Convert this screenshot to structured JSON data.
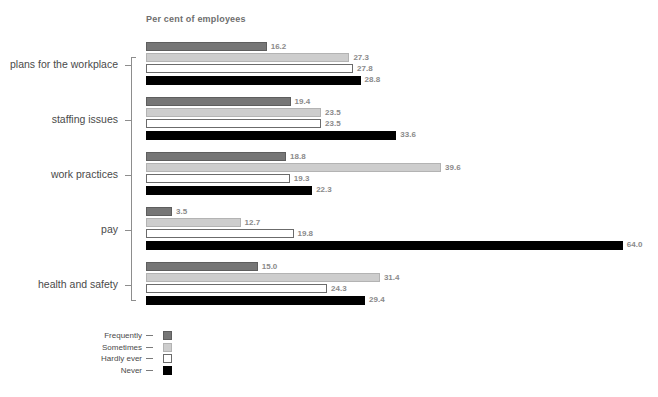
{
  "chart_data": {
    "type": "bar",
    "title": "",
    "xlabel": "Per cent of employees",
    "ylabel": "",
    "orientation": "horizontal",
    "grid": false,
    "legend_position": "bottom-left",
    "xlim": [
      0,
      64
    ],
    "categories": [
      "plans for the workplace",
      "staffing issues",
      "work practices",
      "pay",
      "health and safety"
    ],
    "series": [
      {
        "name": "Frequently",
        "color": "#767676",
        "values": [
          16.2,
          19.4,
          18.8,
          3.5,
          15.0
        ]
      },
      {
        "name": "Sometimes",
        "color": "#cdcdcd",
        "values": [
          27.3,
          23.5,
          39.6,
          12.7,
          31.4
        ]
      },
      {
        "name": "Hardly ever",
        "color": "#ffffff",
        "values": [
          27.8,
          23.5,
          19.3,
          19.8,
          24.3
        ]
      },
      {
        "name": "Never",
        "color": "#000000",
        "values": [
          28.8,
          33.6,
          22.3,
          64.0,
          29.4
        ]
      }
    ],
    "value_labels": [
      [
        "16.2",
        "27.3",
        "27.8",
        "28.8"
      ],
      [
        "19.4",
        "23.5",
        "23.5",
        "33.6"
      ],
      [
        "18.8",
        "39.6",
        "19.3",
        "22.3"
      ],
      [
        "3.5",
        "12.7",
        "19.8",
        "64.0"
      ],
      [
        "15.0",
        "31.4",
        "24.3",
        "29.4"
      ]
    ]
  },
  "axis": {
    "title": "Per cent of employees"
  },
  "groups": [
    {
      "label": "plans for the workplace",
      "bars": [
        {
          "series": "Frequently",
          "value": 16.2,
          "label": "16.2"
        },
        {
          "series": "Sometimes",
          "value": 27.3,
          "label": "27.3"
        },
        {
          "series": "Hardly ever",
          "value": 27.8,
          "label": "27.8"
        },
        {
          "series": "Never",
          "value": 28.8,
          "label": "28.8"
        }
      ]
    },
    {
      "label": "staffing issues",
      "bars": [
        {
          "series": "Frequently",
          "value": 19.4,
          "label": "19.4"
        },
        {
          "series": "Sometimes",
          "value": 23.5,
          "label": "23.5"
        },
        {
          "series": "Hardly ever",
          "value": 23.5,
          "label": "23.5"
        },
        {
          "series": "Never",
          "value": 33.6,
          "label": "33.6"
        }
      ]
    },
    {
      "label": "work practices",
      "bars": [
        {
          "series": "Frequently",
          "value": 18.8,
          "label": "18.8"
        },
        {
          "series": "Sometimes",
          "value": 39.6,
          "label": "39.6"
        },
        {
          "series": "Hardly ever",
          "value": 19.3,
          "label": "19.3"
        },
        {
          "series": "Never",
          "value": 22.3,
          "label": "22.3"
        }
      ]
    },
    {
      "label": "pay",
      "bars": [
        {
          "series": "Frequently",
          "value": 3.5,
          "label": "3.5"
        },
        {
          "series": "Sometimes",
          "value": 12.7,
          "label": "12.7"
        },
        {
          "series": "Hardly ever",
          "value": 19.8,
          "label": "19.8"
        },
        {
          "series": "Never",
          "value": 64.0,
          "label": "64.0"
        }
      ]
    },
    {
      "label": "health and safety",
      "bars": [
        {
          "series": "Frequently",
          "value": 15.0,
          "label": "15.0"
        },
        {
          "series": "Sometimes",
          "value": 31.4,
          "label": "31.4"
        },
        {
          "series": "Hardly ever",
          "value": 24.3,
          "label": "24.3"
        },
        {
          "series": "Never",
          "value": 29.4,
          "label": "29.4"
        }
      ]
    }
  ],
  "legend": {
    "items": [
      {
        "label": "Frequently",
        "key": "frequently",
        "color": "#767676"
      },
      {
        "label": "Sometimes",
        "key": "sometimes",
        "color": "#cdcdcd"
      },
      {
        "label": "Hardly ever",
        "key": "hardly",
        "color": "#ffffff"
      },
      {
        "label": "Never",
        "key": "never",
        "color": "#000000"
      }
    ]
  }
}
